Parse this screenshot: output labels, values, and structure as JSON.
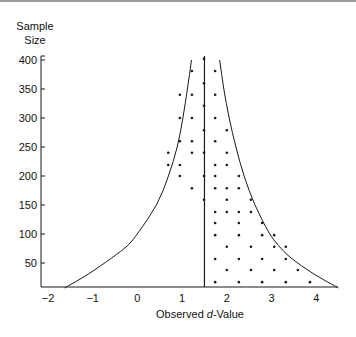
{
  "chart_data": {
    "type": "scatter",
    "title": "",
    "ylabel_lines": [
      "Sample",
      "Size"
    ],
    "xlabel_prefix": "Observed ",
    "xlabel_italic": "d",
    "xlabel_suffix": "-Value",
    "xlim": [
      -2,
      4.5
    ],
    "ylim": [
      7,
      400
    ],
    "x_ticks": [
      -2,
      -1,
      0,
      1,
      2,
      3,
      4
    ],
    "x_tick_labels": [
      "−2",
      "−1",
      "0",
      "1",
      "2",
      "3",
      "4"
    ],
    "y_ticks": [
      50,
      100,
      150,
      200,
      250,
      300,
      350,
      400
    ],
    "y_tick_labels": [
      "50",
      "100",
      "150",
      "200",
      "250",
      "300",
      "350",
      "400"
    ],
    "grid": false,
    "reference_line": {
      "label": "mean d",
      "x": 1.5
    },
    "funnel_left": [
      [
        -1.63,
        7
      ],
      [
        -1.1,
        30
      ],
      [
        -0.55,
        60
      ],
      [
        -0.2,
        80
      ],
      [
        0.0,
        100
      ],
      [
        0.45,
        150
      ],
      [
        0.7,
        200
      ],
      [
        0.9,
        250
      ],
      [
        1.02,
        300
      ],
      [
        1.12,
        350
      ],
      [
        1.21,
        400
      ]
    ],
    "funnel_right": [
      [
        4.5,
        7
      ],
      [
        3.95,
        30
      ],
      [
        3.4,
        60
      ],
      [
        3.15,
        80
      ],
      [
        2.95,
        100
      ],
      [
        2.62,
        150
      ],
      [
        2.38,
        200
      ],
      [
        2.2,
        250
      ],
      [
        2.05,
        300
      ],
      [
        1.93,
        350
      ],
      [
        1.84,
        400
      ]
    ],
    "points": [
      [
        1.49,
        402
      ],
      [
        1.22,
        381
      ],
      [
        1.74,
        381
      ],
      [
        1.49,
        360
      ],
      [
        0.95,
        340
      ],
      [
        1.22,
        340
      ],
      [
        1.74,
        340
      ],
      [
        1.49,
        321
      ],
      [
        0.95,
        300
      ],
      [
        1.22,
        300
      ],
      [
        1.74,
        300
      ],
      [
        1.49,
        279
      ],
      [
        2.0,
        279
      ],
      [
        0.95,
        260
      ],
      [
        1.22,
        260
      ],
      [
        1.74,
        260
      ],
      [
        0.69,
        240
      ],
      [
        1.22,
        240
      ],
      [
        1.49,
        240
      ],
      [
        2.0,
        240
      ],
      [
        0.69,
        219
      ],
      [
        0.95,
        219
      ],
      [
        1.74,
        219
      ],
      [
        2.0,
        219
      ],
      [
        0.95,
        200
      ],
      [
        1.49,
        200
      ],
      [
        1.74,
        200
      ],
      [
        2.27,
        200
      ],
      [
        1.22,
        179
      ],
      [
        1.74,
        179
      ],
      [
        2.0,
        179
      ],
      [
        2.27,
        179
      ],
      [
        1.49,
        159
      ],
      [
        2.0,
        159
      ],
      [
        2.54,
        159
      ],
      [
        1.74,
        138
      ],
      [
        2.0,
        138
      ],
      [
        2.27,
        138
      ],
      [
        2.54,
        138
      ],
      [
        1.74,
        119
      ],
      [
        2.27,
        119
      ],
      [
        2.79,
        119
      ],
      [
        1.74,
        98
      ],
      [
        2.27,
        98
      ],
      [
        2.79,
        98
      ],
      [
        3.06,
        98
      ],
      [
        2.0,
        78
      ],
      [
        2.54,
        78
      ],
      [
        3.06,
        78
      ],
      [
        3.32,
        78
      ],
      [
        1.74,
        57
      ],
      [
        2.27,
        57
      ],
      [
        2.79,
        57
      ],
      [
        3.32,
        57
      ],
      [
        2.0,
        38
      ],
      [
        2.54,
        38
      ],
      [
        3.06,
        38
      ],
      [
        3.59,
        38
      ],
      [
        1.74,
        17
      ],
      [
        2.27,
        17
      ],
      [
        2.79,
        17
      ],
      [
        3.32,
        17
      ],
      [
        3.86,
        17
      ]
    ],
    "colors": {
      "ink": "#1a1a1a",
      "background": "#ffffff"
    }
  }
}
